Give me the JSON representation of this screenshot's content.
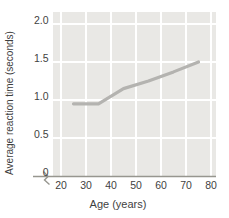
{
  "chart_data": {
    "type": "line",
    "title": "",
    "xlabel": "Age (years)",
    "ylabel": "Average reaction time (seconds)",
    "x_ticks": [
      20,
      30,
      40,
      50,
      60,
      70,
      80
    ],
    "y_ticks": [
      "2.0",
      "1.5",
      "1.0",
      "0.5",
      "0"
    ],
    "y_tick_values": [
      2.0,
      1.5,
      1.0,
      0.5,
      0
    ],
    "xlim": [
      20,
      80
    ],
    "ylim": [
      0,
      2.0
    ],
    "grid": true,
    "x_axis_break_at_origin": true,
    "legend": "none",
    "series": [
      {
        "name": "average reaction time",
        "x": [
          25,
          35,
          45,
          55,
          65,
          75
        ],
        "y": [
          0.95,
          0.95,
          1.15,
          1.25,
          1.37,
          1.5
        ]
      }
    ],
    "colors": {
      "plot_bg": "#e9e8e5",
      "gridline": "#ffffff",
      "line": "#b4b3b0",
      "axis": "#97968f",
      "text": "#3f3f3f"
    }
  }
}
